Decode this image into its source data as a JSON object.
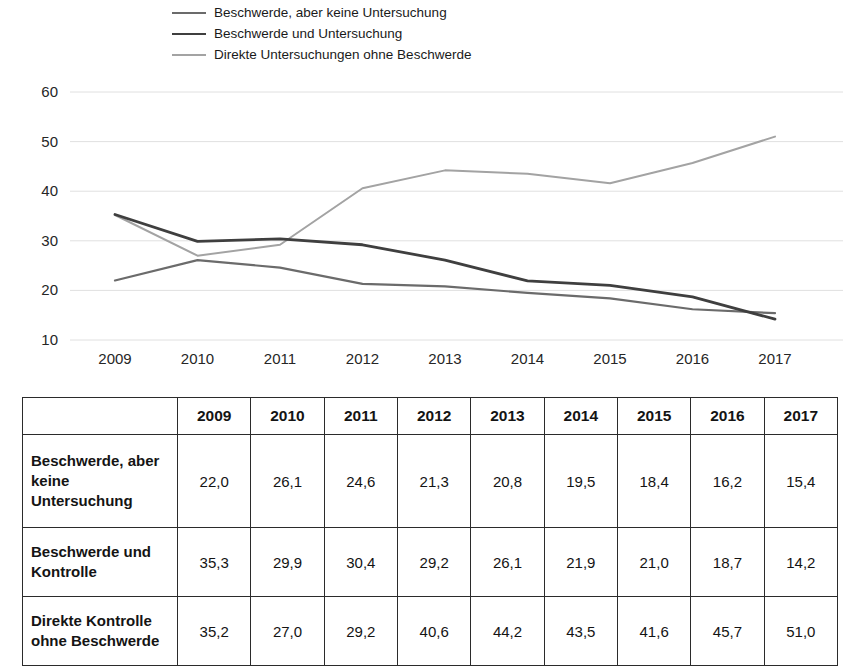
{
  "chart_data": {
    "type": "line",
    "title": "",
    "xlabel": "",
    "ylabel": "",
    "x": [
      2009,
      2010,
      2011,
      2012,
      2013,
      2014,
      2015,
      2016,
      2017
    ],
    "ylim": [
      10,
      60
    ],
    "yticks": [
      60,
      50,
      40,
      30,
      20,
      10
    ],
    "grid": true,
    "legend_position": "top-left",
    "gridline_color": "#e0e0e0",
    "series": [
      {
        "name": "Beschwerde, aber keine Untersuchung",
        "color": "#6b6b6b",
        "stroke_width": 2.2,
        "values": [
          22.0,
          26.1,
          24.6,
          21.3,
          20.8,
          19.5,
          18.4,
          16.2,
          15.4
        ]
      },
      {
        "name": "Beschwerde und Untersuchung",
        "color": "#3f3f3f",
        "stroke_width": 2.8,
        "values": [
          35.3,
          29.9,
          30.4,
          29.2,
          26.1,
          21.9,
          21.0,
          18.7,
          14.2
        ]
      },
      {
        "name": "Direkte Untersuchungen ohne Beschwerde",
        "color": "#a3a3a3",
        "stroke_width": 2.0,
        "values": [
          35.2,
          27.0,
          29.2,
          40.6,
          44.2,
          43.5,
          41.6,
          45.7,
          51.0
        ]
      }
    ]
  },
  "table": {
    "headers": [
      "",
      "2009",
      "2010",
      "2011",
      "2012",
      "2013",
      "2014",
      "2015",
      "2016",
      "2017"
    ],
    "rows": [
      {
        "label": "Beschwerde, aber keine Untersuchung",
        "values": [
          "22,0",
          "26,1",
          "24,6",
          "21,3",
          "20,8",
          "19,5",
          "18,4",
          "16,2",
          "15,4"
        ]
      },
      {
        "label": "Beschwerde und Kontrolle",
        "values": [
          "35,3",
          "29,9",
          "30,4",
          "29,2",
          "26,1",
          "21,9",
          "21,0",
          "18,7",
          "14,2"
        ]
      },
      {
        "label": "Direkte Kontrolle ohne Beschwerde",
        "values": [
          "35,2",
          "27,0",
          "29,2",
          "40,6",
          "44,2",
          "43,5",
          "41,6",
          "45,7",
          "51,0"
        ]
      }
    ]
  }
}
